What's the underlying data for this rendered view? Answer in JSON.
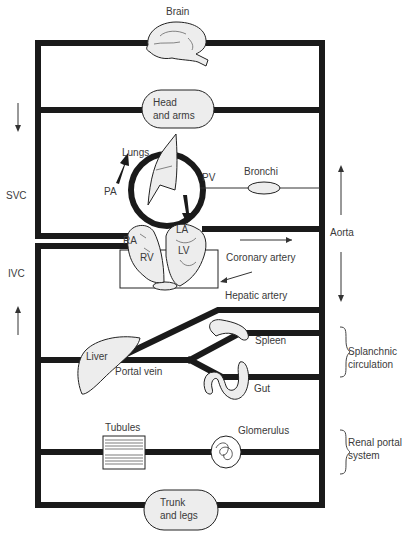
{
  "diagram": {
    "colors": {
      "vessel": "#1a1a1a",
      "organ_fill": "#ededed",
      "outline": "#222222",
      "label": "#3a3a3a",
      "background": "#ffffff"
    },
    "organs": {
      "brain": "Brain",
      "head_arms_line1": "Head",
      "head_arms_line2": "and arms",
      "lungs": "Lungs",
      "bronchi": "Bronchi",
      "liver": "Liver",
      "spleen": "Spleen",
      "gut": "Gut",
      "tubules": "Tubules",
      "glomerulus": "Glomerulus",
      "trunk_legs_line1": "Trunk",
      "trunk_legs_line2": "and legs"
    },
    "heart": {
      "ra": "RA",
      "rv": "RV",
      "la": "LA",
      "lv": "LV"
    },
    "vessels": {
      "pa": "PA",
      "pv": "PV",
      "svc": "SVC",
      "ivc": "IVC",
      "aorta": "Aorta",
      "coronary_artery": "Coronary artery",
      "hepatic_artery": "Hepatic artery",
      "portal_vein": "Portal vein"
    },
    "groups": {
      "splanchnic_line1": "Splanchnic",
      "splanchnic_line2": "circulation",
      "renal_line1": "Renal portal",
      "renal_line2": "system"
    }
  }
}
